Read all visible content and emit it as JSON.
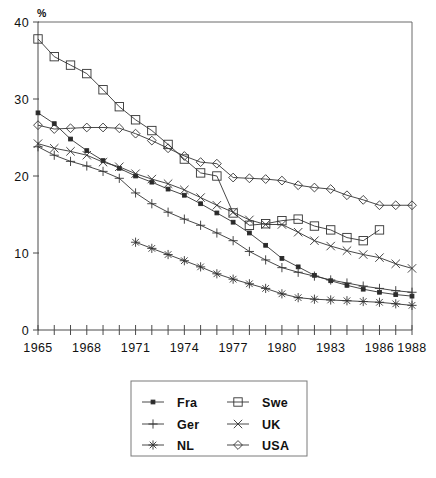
{
  "chart_data": {
    "type": "line",
    "title": "",
    "xlabel": "",
    "ylabel": "%",
    "ylim": [
      0,
      40
    ],
    "xlim": [
      1965,
      1988
    ],
    "grid": false,
    "legend_position": "bottom-center",
    "yticks": [
      "0",
      "10",
      "20",
      "30",
      "40"
    ],
    "ytick_values": [
      0,
      10,
      20,
      30,
      40
    ],
    "xticks": [
      "1965",
      "1968",
      "1971",
      "1974",
      "1977",
      "1980",
      "1983",
      "1986",
      "1988"
    ],
    "xtick_values": [
      1965,
      1968,
      1971,
      1974,
      1977,
      1980,
      1983,
      1986,
      1988
    ],
    "x": [
      1965,
      1966,
      1967,
      1968,
      1969,
      1970,
      1971,
      1972,
      1973,
      1974,
      1975,
      1976,
      1977,
      1978,
      1979,
      1980,
      1981,
      1982,
      1983,
      1984,
      1985,
      1986,
      1987,
      1988
    ],
    "series": [
      {
        "name": "Fra",
        "marker": "filled-square",
        "x": [
          1965,
          1966,
          1967,
          1968,
          1969,
          1970,
          1971,
          1972,
          1973,
          1974,
          1975,
          1976,
          1977,
          1978,
          1979,
          1980,
          1981,
          1982,
          1983,
          1984,
          1985,
          1986,
          1987,
          1988
        ],
        "values": [
          28.2,
          26.8,
          24.8,
          23.3,
          22.0,
          21.0,
          20.0,
          19.2,
          18.3,
          17.5,
          16.4,
          15.2,
          14.0,
          12.6,
          11.0,
          9.3,
          8.2,
          7.1,
          6.4,
          5.8,
          5.3,
          4.9,
          4.6,
          4.4
        ]
      },
      {
        "name": "Ger",
        "marker": "plus",
        "x": [
          1965,
          1966,
          1967,
          1968,
          1969,
          1970,
          1971,
          1972,
          1973,
          1974,
          1975,
          1976,
          1977,
          1978,
          1979,
          1980,
          1981,
          1982,
          1983,
          1984,
          1985,
          1986,
          1987,
          1988
        ],
        "values": [
          23.8,
          22.7,
          21.9,
          21.3,
          20.6,
          19.7,
          17.8,
          16.4,
          15.3,
          14.4,
          13.6,
          12.6,
          11.6,
          10.2,
          9.1,
          8.1,
          7.5,
          7.0,
          6.5,
          6.1,
          5.7,
          5.4,
          5.1,
          4.9
        ]
      },
      {
        "name": "NL",
        "marker": "asterisk",
        "x": [
          1971,
          1972,
          1973,
          1974,
          1975,
          1976,
          1977,
          1978,
          1979,
          1980,
          1981,
          1982,
          1983,
          1984,
          1985,
          1986,
          1987,
          1988
        ],
        "values": [
          11.4,
          10.6,
          9.8,
          9.0,
          8.2,
          7.3,
          6.6,
          6.0,
          5.4,
          4.7,
          4.2,
          4.0,
          3.9,
          3.8,
          3.7,
          3.6,
          3.4,
          3.2
        ]
      },
      {
        "name": "Swe",
        "marker": "open-square",
        "x": [
          1965,
          1966,
          1967,
          1968,
          1969,
          1970,
          1971,
          1972,
          1973,
          1974,
          1975,
          1976,
          1977,
          1978,
          1979,
          1980,
          1981,
          1982,
          1983,
          1984,
          1985,
          1986
        ],
        "values": [
          37.8,
          35.5,
          34.4,
          33.3,
          31.2,
          29.0,
          27.3,
          25.9,
          24.1,
          22.2,
          20.4,
          20.0,
          15.2,
          13.6,
          13.8,
          14.2,
          14.4,
          13.5,
          13.0,
          12.0,
          11.6,
          13.0
        ]
      },
      {
        "name": "UK",
        "marker": "cross",
        "x": [
          1965,
          1966,
          1967,
          1968,
          1969,
          1970,
          1971,
          1972,
          1973,
          1974,
          1975,
          1976,
          1977,
          1978,
          1979,
          1980,
          1981,
          1982,
          1983,
          1984,
          1985,
          1986,
          1987,
          1988
        ],
        "values": [
          24.2,
          23.6,
          23.2,
          22.7,
          21.8,
          21.2,
          20.3,
          19.6,
          19.0,
          18.2,
          17.2,
          16.2,
          15.3,
          14.3,
          13.7,
          13.7,
          12.7,
          11.6,
          10.9,
          10.3,
          9.8,
          9.4,
          8.6,
          8.0
        ]
      },
      {
        "name": "USA",
        "marker": "open-diamond",
        "x": [
          1965,
          1966,
          1967,
          1968,
          1969,
          1970,
          1971,
          1972,
          1973,
          1974,
          1975,
          1976,
          1977,
          1978,
          1979,
          1980,
          1981,
          1982,
          1983,
          1984,
          1985,
          1986,
          1987,
          1988
        ],
        "values": [
          26.6,
          26.1,
          26.2,
          26.3,
          26.3,
          26.2,
          25.5,
          24.6,
          23.6,
          22.6,
          21.8,
          21.6,
          19.8,
          19.7,
          19.6,
          19.4,
          18.8,
          18.5,
          18.3,
          17.5,
          16.9,
          16.2,
          16.2,
          16.2
        ]
      }
    ],
    "legend": [
      {
        "label": "Fra",
        "marker": "filled-square"
      },
      {
        "label": "Swe",
        "marker": "open-square"
      },
      {
        "label": "Ger",
        "marker": "plus"
      },
      {
        "label": "UK",
        "marker": "cross"
      },
      {
        "label": "NL",
        "marker": "asterisk"
      },
      {
        "label": "USA",
        "marker": "open-diamond"
      }
    ]
  },
  "colors": {
    "line": "#333333",
    "axis": "#4a4a4a",
    "frame": "#6b6b6b",
    "text": "#111111",
    "background": "#ffffff"
  }
}
